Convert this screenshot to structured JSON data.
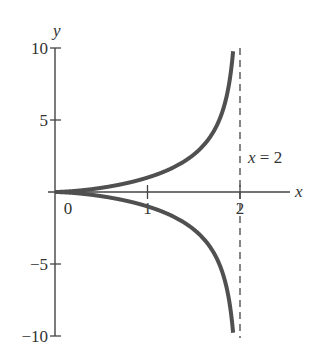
{
  "chart_data": {
    "type": "line",
    "title": "",
    "xlabel": "x",
    "ylabel": "y",
    "xlim": [
      0,
      2.6
    ],
    "ylim": [
      -10,
      10
    ],
    "grid": false,
    "legend": null,
    "x_ticks": [
      {
        "value": 0,
        "label": "0"
      },
      {
        "value": 1,
        "label": "1"
      },
      {
        "value": 2,
        "label": "2"
      }
    ],
    "y_ticks": [
      {
        "value": 10,
        "label": "10"
      },
      {
        "value": 5,
        "label": "5"
      },
      {
        "value": -5,
        "label": "−5"
      },
      {
        "value": -10,
        "label": "−10"
      }
    ],
    "series": [
      {
        "name": "upper branch",
        "color": "#505050",
        "x": [
          0,
          0.25,
          0.5,
          0.75,
          1.0,
          1.25,
          1.5,
          1.7,
          1.8,
          1.9,
          1.95,
          1.98
        ],
        "y": [
          0,
          0.047,
          0.204,
          0.485,
          1.0,
          1.614,
          2.598,
          4.064,
          5.4,
          8.28,
          12.0,
          19.8
        ]
      },
      {
        "name": "lower branch",
        "color": "#505050",
        "x": [
          0,
          0.25,
          0.5,
          0.75,
          1.0,
          1.25,
          1.5,
          1.7,
          1.8,
          1.9,
          1.95,
          1.98
        ],
        "y": [
          0,
          -0.047,
          -0.204,
          -0.485,
          -1.0,
          -1.614,
          -2.598,
          -4.064,
          -5.4,
          -8.28,
          -12.0,
          -19.8
        ]
      }
    ],
    "asymptotes": [
      {
        "type": "vertical",
        "x": 2,
        "style": "dashed",
        "label": "x = 2"
      }
    ],
    "annotations": [
      {
        "text": "x = 2",
        "x": 2.05,
        "y": 3.7
      }
    ]
  },
  "labels": {
    "x_axis": "x",
    "y_axis": "y",
    "asymptote_var": "x",
    "asymptote_eq": " = 2"
  }
}
